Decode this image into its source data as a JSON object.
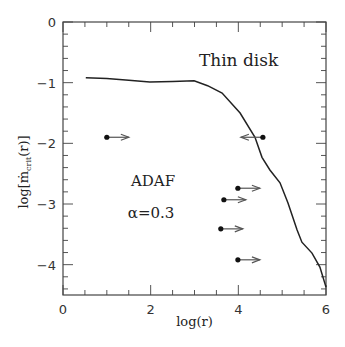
{
  "chart_data": {
    "type": "line",
    "title": "",
    "xlabel": "log(r)",
    "ylabel": {
      "prefix": "log[",
      "main": "ṁ",
      "sub": "crit",
      "suffix": "(r)]"
    },
    "xlim": [
      0,
      6
    ],
    "ylim": [
      -4.5,
      0
    ],
    "grid": false,
    "x_ticks": {
      "major": [
        0,
        2,
        4,
        6
      ],
      "labels": [
        "0",
        "2",
        "4",
        "6"
      ],
      "minor_step": 0.5
    },
    "y_ticks": {
      "major": [
        0,
        -1,
        -2,
        -3,
        -4
      ],
      "labels": [
        "0",
        "−1",
        "−2",
        "−3",
        "−4"
      ],
      "minor_step": 0.2
    },
    "series": [
      {
        "name": "critical accretion rate",
        "x": [
          0.52,
          1.0,
          1.5,
          1.98,
          2.5,
          2.99,
          3.3,
          3.63,
          4.04,
          4.38,
          4.54,
          4.72,
          4.95,
          5.13,
          5.34,
          5.45,
          5.68,
          5.86,
          6.0
        ],
        "y": [
          -0.92,
          -0.93,
          -0.96,
          -0.99,
          -0.98,
          -0.97,
          -1.05,
          -1.17,
          -1.5,
          -1.9,
          -2.23,
          -2.44,
          -2.65,
          -2.98,
          -3.43,
          -3.63,
          -3.81,
          -4.04,
          -4.37
        ]
      }
    ],
    "points": [
      {
        "x": 1.0,
        "y": -1.9,
        "direction": "right"
      },
      {
        "x": 4.56,
        "y": -1.9,
        "direction": "left"
      },
      {
        "x": 3.99,
        "y": -2.74,
        "direction": "right"
      },
      {
        "x": 3.67,
        "y": -2.93,
        "direction": "right"
      },
      {
        "x": 3.6,
        "y": -3.41,
        "direction": "right"
      },
      {
        "x": 3.99,
        "y": -3.92,
        "direction": "right"
      }
    ],
    "annotations": [
      {
        "text": "Thin disk",
        "x": 3.1,
        "y": -0.72
      },
      {
        "text": "ADAF",
        "x": 1.55,
        "y": -2.7
      },
      {
        "text": "α=0.3",
        "x": 1.48,
        "y": -3.23
      }
    ]
  }
}
